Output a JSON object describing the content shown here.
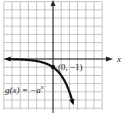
{
  "chart_data": {
    "type": "line",
    "title": "",
    "function_label": "g(x) = −a^x",
    "function_label_parts": {
      "lhs": "g(x) = −a",
      "exponent": "x"
    },
    "xlabel": "x",
    "ylabel": "",
    "grid": true,
    "xlim": [
      -6,
      6
    ],
    "ylim": [
      -6,
      7
    ],
    "annotated_point": {
      "x": 0,
      "y": -1,
      "label": "(0, −1)"
    },
    "asymptote": {
      "type": "horizontal",
      "y": 0
    },
    "series": [
      {
        "name": "g(x) = −a^x",
        "x": [
          -6,
          -5,
          -4,
          -3,
          -2,
          -1,
          0,
          0.5,
          1,
          1.5,
          2,
          2.5
        ],
        "y": [
          -0.02,
          -0.03,
          -0.06,
          -0.13,
          -0.25,
          -0.5,
          -1,
          -1.41,
          -2,
          -2.83,
          -4,
          -5.66
        ]
      }
    ]
  },
  "colors": {
    "grid": "#b8b8b8",
    "axis": "#222222",
    "curve": "#111111",
    "background": "#ffffff"
  }
}
